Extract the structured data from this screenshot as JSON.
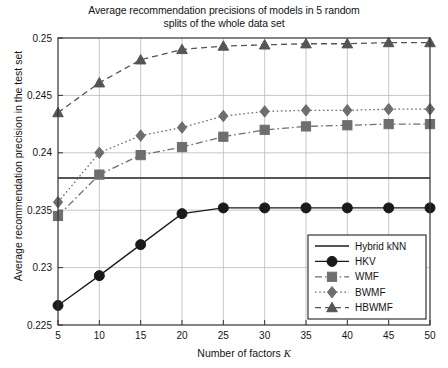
{
  "chart_data": {
    "type": "line",
    "title": "Average recommendation precisions of models in 5 random splits of the whole data set",
    "title_line1": "Average recommendation precisions of models in 5 random",
    "title_line2": "splits of the whole data set",
    "xlabel": "Number of factors K",
    "xlabel_text": "Number of factors ",
    "xlabel_italic": "K",
    "ylabel": "Average recommendation precision in the test set",
    "x": [
      5,
      10,
      15,
      20,
      25,
      30,
      35,
      40,
      45,
      50
    ],
    "xticks": [
      "5",
      "10",
      "15",
      "20",
      "25",
      "30",
      "35",
      "40",
      "45",
      "50"
    ],
    "yticks": [
      "0.225",
      "0.23",
      "0.235",
      "0.24",
      "0.245",
      "0.25"
    ],
    "ytickvals": [
      0.225,
      0.23,
      0.235,
      0.24,
      0.245,
      0.25
    ],
    "xlim": [
      5,
      50
    ],
    "ylim": [
      0.225,
      0.25
    ],
    "grid": true,
    "legend_position": "lower right",
    "series": [
      {
        "name": "Hybrid kNN",
        "marker": "none",
        "linestyle": "solid",
        "color": "#555555",
        "constant": 0.2378,
        "values": [
          0.2378,
          0.2378,
          0.2378,
          0.2378,
          0.2378,
          0.2378,
          0.2378,
          0.2378,
          0.2378,
          0.2378
        ]
      },
      {
        "name": "HKV",
        "marker": "circle",
        "linestyle": "solid",
        "color": "#1a1a1a",
        "values": [
          0.2267,
          0.2293,
          0.232,
          0.2347,
          0.2352,
          0.2352,
          0.2352,
          0.2352,
          0.2352,
          0.2352
        ]
      },
      {
        "name": "WMF",
        "marker": "square",
        "linestyle": "dashdot",
        "color": "#6e6e6e",
        "values": [
          0.2345,
          0.2381,
          0.2398,
          0.2405,
          0.2414,
          0.242,
          0.2423,
          0.2424,
          0.2425,
          0.2425
        ]
      },
      {
        "name": "BWMF",
        "marker": "diamond",
        "linestyle": "dotted",
        "color": "#6e6e6e",
        "values": [
          0.2357,
          0.24,
          0.2415,
          0.2422,
          0.2432,
          0.2436,
          0.2437,
          0.2437,
          0.2438,
          0.2438
        ]
      },
      {
        "name": "HBWMF",
        "marker": "triangle",
        "linestyle": "dashed",
        "color": "#555555",
        "values": [
          0.2435,
          0.2461,
          0.2481,
          0.249,
          0.2493,
          0.2494,
          0.2495,
          0.2495,
          0.2496,
          0.2496
        ]
      }
    ]
  },
  "legend": {
    "items": [
      {
        "label": "Hybrid kNN"
      },
      {
        "label": "HKV"
      },
      {
        "label": "WMF"
      },
      {
        "label": "BWMF"
      },
      {
        "label": "HBWMF"
      }
    ]
  },
  "colors": {
    "axis": "#333333",
    "grid": "#b9b9b9",
    "dark_marker": "#1a1a1a",
    "gray_marker": "#6e6e6e",
    "background": "#ffffff"
  }
}
